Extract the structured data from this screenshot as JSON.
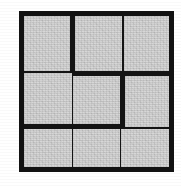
{
  "figure": {
    "name": "three-by-three-grid-figure",
    "canvas": {
      "width": 181,
      "height": 186,
      "background_color": "#ffffff"
    },
    "frame": {
      "stroke_color": "#121212",
      "stroke_width": 5,
      "left": 19,
      "top": 11,
      "width": 155,
      "height": 161
    },
    "cell_fill_color": "#d2d2d2",
    "divider_color": "#141414",
    "rows": 3,
    "columns": 3,
    "cells": [
      {
        "id": "r1c1",
        "row": 1,
        "column": 1,
        "label": ""
      },
      {
        "id": "r1c2",
        "row": 1,
        "column": 2,
        "label": ""
      },
      {
        "id": "r1c3",
        "row": 1,
        "column": 3,
        "label": ""
      },
      {
        "id": "r2c1",
        "row": 2,
        "column": 1,
        "label": ""
      },
      {
        "id": "r2c2",
        "row": 2,
        "column": 2,
        "label": ""
      },
      {
        "id": "r2c3",
        "row": 2,
        "column": 3,
        "label": ""
      },
      {
        "id": "r3c1",
        "row": 3,
        "column": 1,
        "label": ""
      },
      {
        "id": "r3c2",
        "row": 3,
        "column": 2,
        "label": ""
      },
      {
        "id": "r3c3",
        "row": 3,
        "column": 3,
        "label": ""
      }
    ],
    "dividers": {
      "vertical_1_weight": [
        "thick",
        "thin",
        "thin"
      ],
      "vertical_2_weight": [
        "thin",
        "thick",
        "thin"
      ],
      "horizontal_1_weight": [
        "thin",
        "thick",
        "thick"
      ],
      "horizontal_2_weight": [
        "thick",
        "thick",
        "thin"
      ]
    }
  }
}
